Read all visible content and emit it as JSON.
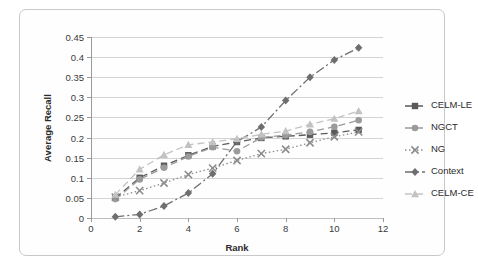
{
  "chart_data": {
    "type": "line",
    "title": "",
    "xlabel": "Rank",
    "ylabel": "Average Recall",
    "xlim": [
      0,
      12
    ],
    "ylim": [
      0,
      0.45
    ],
    "xticks": [
      0,
      2,
      4,
      6,
      8,
      10,
      12
    ],
    "xtick_labels": [
      "0",
      "2",
      "4",
      "6",
      "8",
      "10",
      "12"
    ],
    "yticks": [
      0,
      0.05,
      0.1,
      0.15,
      0.2,
      0.25,
      0.3,
      0.35,
      0.4,
      0.45
    ],
    "ytick_labels": [
      "0",
      "0.05",
      "0.1",
      "0.15",
      "0.2",
      "0.25",
      "0.3",
      "0.35",
      "0.4",
      "0.45"
    ],
    "grid": "horizontal",
    "legend_position": "right",
    "x": [
      1,
      2,
      3,
      4,
      5,
      6,
      7,
      8,
      9,
      10,
      11
    ],
    "series": [
      {
        "name": "CELM-LE",
        "color": "#5a5a5a",
        "marker": "square",
        "dash": "7,4",
        "values": [
          0.05,
          0.1,
          0.13,
          0.156,
          0.178,
          0.189,
          0.199,
          0.203,
          0.207,
          0.212,
          0.219
        ]
      },
      {
        "name": "NGCT",
        "color": "#9b9b9b",
        "marker": "circle",
        "dash": "7,4",
        "values": [
          0.047,
          0.096,
          0.125,
          0.153,
          0.176,
          0.166,
          0.2,
          0.206,
          0.214,
          0.227,
          0.243
        ]
      },
      {
        "name": "NG",
        "color": "#8d8d8d",
        "marker": "cross",
        "dash": "1.5,2.5",
        "values": [
          0.052,
          0.068,
          0.087,
          0.108,
          0.124,
          0.143,
          0.16,
          0.171,
          0.187,
          0.202,
          0.214
        ]
      },
      {
        "name": "Context",
        "color": "#6e6e6e",
        "marker": "diamond",
        "dash": "9,3,2,3",
        "values": [
          0.003,
          0.009,
          0.03,
          0.062,
          0.11,
          0.19,
          0.226,
          0.292,
          0.35,
          0.393,
          0.423
        ]
      },
      {
        "name": "CELM-CE",
        "color": "#c2c2c2",
        "marker": "triangle",
        "dash": "7,4",
        "values": [
          0.058,
          0.121,
          0.157,
          0.182,
          0.189,
          0.197,
          0.208,
          0.216,
          0.233,
          0.247,
          0.266
        ]
      }
    ]
  },
  "legend": {
    "items": [
      {
        "label": "CELM-LE"
      },
      {
        "label": "NGCT"
      },
      {
        "label": "NG"
      },
      {
        "label": "Context"
      },
      {
        "label": "CELM-CE"
      }
    ]
  }
}
